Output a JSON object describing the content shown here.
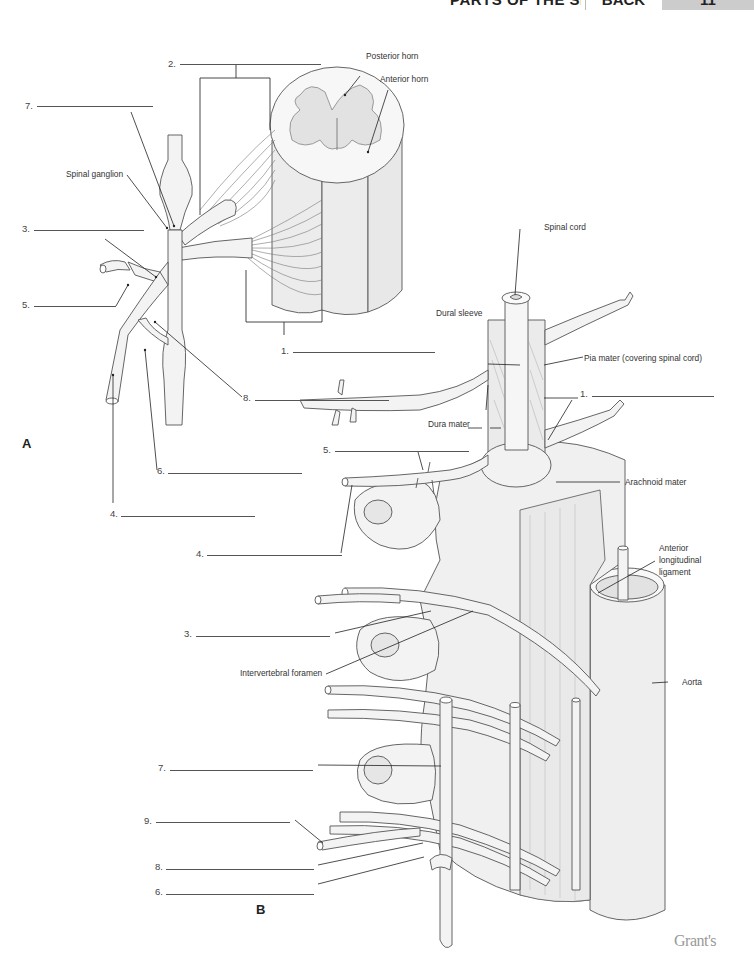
{
  "header": {
    "title": "PARTS OF THE SPINAL NERVE",
    "section": "BACK",
    "page": "11"
  },
  "panels": {
    "a": "A",
    "b": "B"
  },
  "figure_a": {
    "labels": {
      "posterior_horn": "Posterior horn",
      "anterior_horn": "Anterior horn",
      "spinal_ganglion": "Spinal ganglion"
    },
    "blanks": [
      {
        "number": "2.",
        "answer": ""
      },
      {
        "number": "7.",
        "answer": ""
      },
      {
        "number": "3.",
        "answer": ""
      },
      {
        "number": "5.",
        "answer": ""
      },
      {
        "number": "1.",
        "answer": ""
      },
      {
        "number": "8.",
        "answer": ""
      },
      {
        "number": "6.",
        "answer": ""
      },
      {
        "number": "4.",
        "answer": ""
      }
    ]
  },
  "figure_b": {
    "labels": {
      "spinal_cord": "Spinal cord",
      "dural_sleeve": "Dural sleeve",
      "pia_mater": "Pia mater (covering spinal cord)",
      "dura_mater": "Dura mater",
      "arachnoid_mater": "Arachnoid mater",
      "anterior_longitudinal_ligament_1": "Anterior",
      "anterior_longitudinal_ligament_2": "longitudinal",
      "anterior_longitudinal_ligament_3": "ligament",
      "intervertebral_foramen": "Intervertebral foramen",
      "aorta": "Aorta"
    },
    "blanks": [
      {
        "number": "1.",
        "answer": ""
      },
      {
        "number": "5.",
        "answer": ""
      },
      {
        "number": "4.",
        "answer": ""
      },
      {
        "number": "3.",
        "answer": ""
      },
      {
        "number": "7.",
        "answer": ""
      },
      {
        "number": "9.",
        "answer": ""
      },
      {
        "number": "8.",
        "answer": ""
      },
      {
        "number": "6.",
        "answer": ""
      }
    ]
  },
  "footer": {
    "brand": "Grant's"
  }
}
